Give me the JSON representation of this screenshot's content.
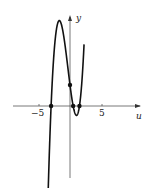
{
  "chart_data": {
    "type": "line",
    "title": "",
    "xlabel": "u",
    "ylabel": "y",
    "xticks": [
      -5,
      5
    ],
    "xtick_labels": [
      "-5",
      "5"
    ],
    "xlim": [
      -11,
      12
    ],
    "grid": false,
    "legend": null,
    "function": "cubic with roots at u = -3, 0.5, 1.5",
    "roots": [
      -3,
      0.5,
      1.5
    ],
    "y_intercept": 3.5,
    "marked_points": [
      {
        "u": -3,
        "y": 0
      },
      {
        "u": 0,
        "y": 3.5
      },
      {
        "u": 0.5,
        "y": 0
      },
      {
        "u": 1.5,
        "y": 0
      }
    ],
    "local_max": {
      "u": -1.6,
      "y": 11.5
    },
    "series": [
      {
        "name": "y(u)",
        "x": [
          -3.5,
          -3,
          -2.5,
          -2,
          -1.6,
          -1,
          -0.5,
          0,
          0.5,
          1,
          1.5,
          2,
          2.2
        ],
        "values": [
          -12.5,
          0,
          7.5,
          10.9,
          11.5,
          9.0,
          6.2,
          3.5,
          0,
          -0.7,
          0,
          5.3,
          9.5
        ]
      }
    ]
  },
  "labels": {
    "x_axis": "u",
    "y_axis": "y",
    "tick_neg5": "−5",
    "tick_pos5": "5"
  }
}
